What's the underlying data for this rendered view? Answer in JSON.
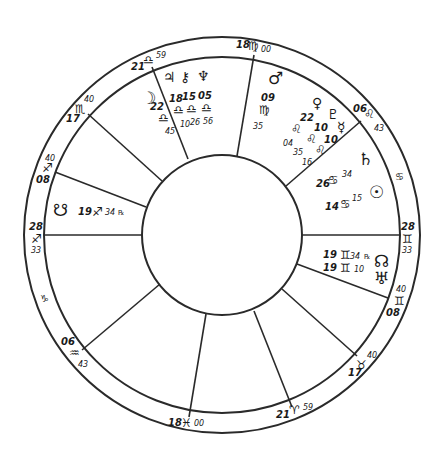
{
  "chart": {
    "type": "natal-wheel",
    "center": [
      222,
      235
    ],
    "radii": {
      "outer": 198,
      "cusp_ring": 178,
      "inner": 80
    }
  },
  "cusps": [
    {
      "id": "asc",
      "deg": "28",
      "sign": "♐",
      "min": "33"
    },
    {
      "id": "h2",
      "deg": "15",
      "sign": "♑",
      "min": ""
    },
    {
      "id": "h3",
      "deg": "06",
      "sign": "♒",
      "min": "43"
    },
    {
      "id": "ic",
      "deg": "18",
      "sign": "♓",
      "min": "00"
    },
    {
      "id": "h5",
      "deg": "21",
      "sign": "♈",
      "min": "59"
    },
    {
      "id": "h6",
      "deg": "17",
      "sign": "♉",
      "min": "40"
    },
    {
      "id": "dsc",
      "deg": "28",
      "sign": "♊",
      "min": "33"
    },
    {
      "id": "h8",
      "deg": "08",
      "sign": "♊",
      "min": "40"
    },
    {
      "id": "h9",
      "deg": "06",
      "sign": "♌",
      "min": "43"
    },
    {
      "id": "mc",
      "deg": "18",
      "sign": "♍",
      "min": "00"
    },
    {
      "id": "h11",
      "deg": "21",
      "sign": "♎",
      "min": "59"
    },
    {
      "id": "h12",
      "deg": "17",
      "sign": "♏",
      "min": "40"
    },
    {
      "id": "h1",
      "deg": "08",
      "sign": "♐",
      "min": "40"
    },
    {
      "id": "intercepted_cancer",
      "deg": "",
      "sign": "♋",
      "min": ""
    }
  ],
  "planets": [
    {
      "name": "Moon",
      "glyph": "☽",
      "deg": "22",
      "sign": "♎",
      "min": "45"
    },
    {
      "name": "Jupiter",
      "glyph": "♃",
      "deg": "18",
      "sign": "♎",
      "min": "10"
    },
    {
      "name": "Chiron",
      "glyph": "⚷",
      "deg": "15",
      "sign": "♎",
      "min": "26"
    },
    {
      "name": "Neptune",
      "glyph": "♆",
      "deg": "05",
      "sign": "♎",
      "min": "56"
    },
    {
      "name": "Mars",
      "glyph": "♂",
      "deg": "09",
      "sign": "♍",
      "min": "35"
    },
    {
      "name": "Venus",
      "glyph": "♀",
      "deg": "22",
      "sign": "♌",
      "min": "04"
    },
    {
      "name": "Pluto",
      "glyph": "♇",
      "deg": "10",
      "sign": "♌",
      "min": "35"
    },
    {
      "name": "Mercury",
      "glyph": "☿",
      "deg": "10",
      "sign": "♌",
      "min": "16"
    },
    {
      "name": "Saturn",
      "glyph": "♄",
      "deg": "26",
      "sign": "♋",
      "min": "34"
    },
    {
      "name": "Sun",
      "glyph": "☉",
      "deg": "14",
      "sign": "♋",
      "min": "15"
    },
    {
      "name": "North Node",
      "glyph": "☊",
      "deg": "19",
      "sign": "♊",
      "min": "34",
      "retro": "℞"
    },
    {
      "name": "Uranus",
      "glyph": "♅",
      "deg": "19",
      "sign": "♊",
      "min": "10"
    },
    {
      "name": "South Node",
      "glyph": "☋",
      "deg": "19",
      "sign": "♐",
      "min": "34",
      "retro": "℞"
    }
  ]
}
